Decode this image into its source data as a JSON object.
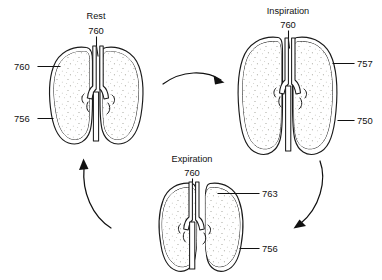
{
  "figure": {
    "title_present": false,
    "background_color": "#ffffff",
    "ink_color": "#111111",
    "stipple_color": "#8c8c80"
  },
  "states": [
    {
      "id": "rest",
      "name": "Rest",
      "trachea_ref": "760",
      "callouts": [
        {
          "id": "rest-left-760",
          "ref": "760",
          "side": "left"
        },
        {
          "id": "rest-left-756",
          "ref": "756",
          "side": "left"
        }
      ]
    },
    {
      "id": "inspiration",
      "name": "Inspiration",
      "trachea_ref": "760",
      "callouts": [
        {
          "id": "insp-right-757",
          "ref": "757",
          "side": "right"
        },
        {
          "id": "insp-right-750",
          "ref": "750",
          "side": "right"
        }
      ]
    },
    {
      "id": "expiration",
      "name": "Expiration",
      "trachea_ref": "760",
      "callouts": [
        {
          "id": "exp-right-763",
          "ref": "763",
          "side": "right"
        },
        {
          "id": "exp-right-756",
          "ref": "756",
          "side": "right"
        }
      ]
    }
  ],
  "arrows": [
    {
      "id": "arrow-rest-to-inspiration",
      "from": "rest",
      "to": "inspiration",
      "direction": "right"
    },
    {
      "id": "arrow-inspiration-to-expiration",
      "from": "inspiration",
      "to": "expiration",
      "direction": "down-left"
    },
    {
      "id": "arrow-expiration-to-rest",
      "from": "expiration",
      "to": "rest",
      "direction": "up-left"
    }
  ]
}
